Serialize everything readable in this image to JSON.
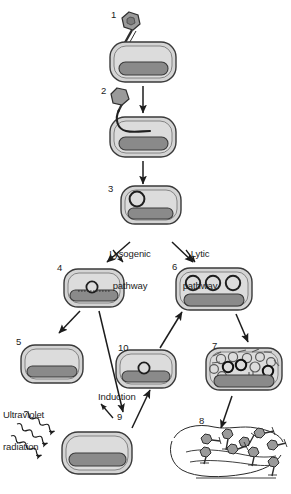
{
  "figure": {
    "colors": {
      "cell_fill": "#d4d4d4",
      "cell_inner_fill": "#d9d9d9",
      "cell_stroke": "#3a3a3a",
      "chromosome_fill": "#8a8a8a",
      "chromosome_stroke": "#3a3a3a",
      "phage_fill": "#9a9a9a",
      "phage_stroke": "#2e2e2e",
      "arrow_stroke": "#1c1c1c",
      "text": "#1c1c1c",
      "background": "#ffffff"
    }
  },
  "steps": [
    {
      "id": "1",
      "label": "1",
      "x": 111,
      "y": 10,
      "description": "phage attaches to bacterial cell"
    },
    {
      "id": "2",
      "label": "2",
      "x": 101,
      "y": 86,
      "description": "phage injects DNA into cell"
    },
    {
      "id": "3",
      "label": "3",
      "x": 108,
      "y": 184,
      "description": "phage DNA circularizes in cytoplasm"
    },
    {
      "id": "4",
      "label": "4",
      "x": 57,
      "y": 263,
      "description": "prophage integrated into bacterial chromosome"
    },
    {
      "id": "5",
      "label": "5",
      "x": 16,
      "y": 337,
      "description": "lysogenic cell replicates with prophage"
    },
    {
      "id": "6",
      "label": "6",
      "x": 172,
      "y": 262,
      "description": "phage DNA replicates in cytoplasm"
    },
    {
      "id": "7",
      "label": "7",
      "x": 212,
      "y": 341,
      "description": "phage components assemble inside cell"
    },
    {
      "id": "8",
      "label": "8",
      "x": 199,
      "y": 416,
      "description": "cell lyses and releases new phages"
    },
    {
      "id": "9",
      "label": "9",
      "x": 117,
      "y": 412,
      "description": "prophage excised after UV exposure"
    },
    {
      "id": "10",
      "label": "10",
      "x": 118,
      "y": 343,
      "description": "induction returns phage DNA to lytic pathway"
    }
  ],
  "captions": [
    {
      "id": "lysogenic",
      "line1": "Lysogenic",
      "line2": "pathway",
      "x": 88,
      "y": 228,
      "width": 84
    },
    {
      "id": "lytic",
      "line1": "Lytic",
      "line2": "pathway",
      "x": 167,
      "y": 228,
      "width": 66
    },
    {
      "id": "ultraviolet",
      "line1": "Ultraviolet",
      "line2": "radiation",
      "x": 3,
      "y": 389,
      "width": 72
    },
    {
      "id": "induction",
      "line1": "Induction",
      "line2": "",
      "x": 98,
      "y": 392,
      "width": 62
    }
  ],
  "arrows": [
    {
      "id": "arrow-1-to-2",
      "from": "1",
      "to": "2",
      "type": "straight"
    },
    {
      "id": "arrow-2-to-3",
      "from": "2",
      "to": "3",
      "type": "straight"
    },
    {
      "id": "arrow-3-to-4",
      "from": "3",
      "to": "4",
      "type": "diagonal-left"
    },
    {
      "id": "arrow-3-to-6",
      "from": "3",
      "to": "6",
      "type": "diagonal-right"
    },
    {
      "id": "arrow-4-to-5",
      "from": "4",
      "to": "5",
      "type": "diagonal-left"
    },
    {
      "id": "arrow-4-to-9",
      "from": "4",
      "to": "9",
      "type": "diagonal-right"
    },
    {
      "id": "arrow-9-to-10",
      "from": "9",
      "to": "10",
      "type": "induction"
    },
    {
      "id": "arrow-10-to-6",
      "from": "10",
      "to": "6",
      "type": "diagonal-right"
    },
    {
      "id": "arrow-6-to-7",
      "from": "6",
      "to": "7",
      "type": "diagonal-right"
    },
    {
      "id": "arrow-7-to-8",
      "from": "7",
      "to": "8",
      "type": "diagonal-right"
    },
    {
      "id": "arrow-uv-to-9",
      "from": "ultraviolet",
      "to": "9",
      "type": "wavy-rays",
      "count": 3
    }
  ],
  "phage_particles": {
    "released_count": 9,
    "head_shape": "hexagon",
    "has_tail": true,
    "has_tail_fibers": true
  },
  "cell_contents": {
    "step3_free_dna_circles": 1,
    "step4_prophage_circles": 1,
    "step6_dna_circles": 3,
    "step7_assembly_circles": 11,
    "step10_prophage_circles": 1
  }
}
